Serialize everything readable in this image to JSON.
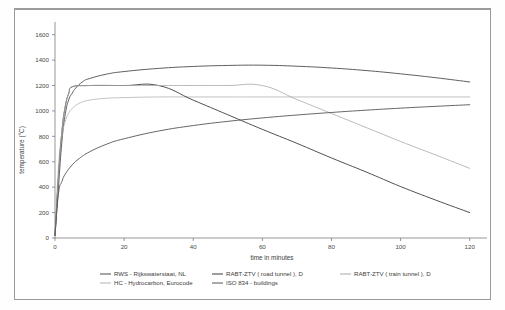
{
  "figure": {
    "frame_color": "#9a9a9a",
    "background": "#ffffff"
  },
  "axes": {
    "x_title": "time in minutes",
    "y_title": "temperature (°C)",
    "x_ticks": [
      "0",
      "20",
      "40",
      "60",
      "80",
      "100",
      "120"
    ],
    "y_ticks": [
      "0",
      "200",
      "400",
      "600",
      "800",
      "1000",
      "1200",
      "1400",
      "1600"
    ]
  },
  "legend": {
    "items": [
      {
        "label": "RWS - Rijkswaterstaat, NL",
        "color": "#4d4d4d",
        "name": "legend-rws"
      },
      {
        "label": "RABT-ZTV ( road tunnel ), D",
        "color": "#3d3d3d",
        "name": "legend-rabt-road"
      },
      {
        "label": "RABT-ZTV ( train tunnel ), D",
        "color": "#a8a8a8",
        "name": "legend-rabt-train"
      },
      {
        "label": "HC -  Hydrocarbon, Eurocode",
        "color": "#b3b3b3",
        "name": "legend-hc"
      },
      {
        "label": "ISO 834 - buildings",
        "color": "#555555",
        "name": "legend-iso834"
      }
    ]
  },
  "chart_data": {
    "type": "line",
    "title": "",
    "xlabel": "time in minutes",
    "ylabel": "temperature (°C)",
    "xlim": [
      0,
      125
    ],
    "ylim": [
      0,
      1700
    ],
    "xticks": [
      0,
      20,
      40,
      60,
      80,
      100,
      120
    ],
    "yticks": [
      0,
      200,
      400,
      600,
      800,
      1000,
      1200,
      1400,
      1600
    ],
    "grid": false,
    "legend_position": "below",
    "series": [
      {
        "name": "RWS - Rijkswaterstaat, NL",
        "color": "#4d4d4d",
        "width": 0.9,
        "x": [
          0,
          1,
          2,
          3,
          4,
          5,
          6,
          8,
          10,
          15,
          20,
          30,
          40,
          50,
          60,
          70,
          80,
          90,
          100,
          110,
          120
        ],
        "y": [
          20,
          400,
          760,
          980,
          1090,
          1140,
          1180,
          1230,
          1255,
          1290,
          1310,
          1335,
          1350,
          1358,
          1360,
          1352,
          1338,
          1318,
          1292,
          1262,
          1228
        ]
      },
      {
        "name": "HC - Hydrocarbon, Eurocode",
        "color": "#b3b3b3",
        "width": 0.8,
        "x": [
          0,
          1,
          2,
          3,
          4,
          5,
          7,
          10,
          15,
          20,
          30,
          40,
          50,
          60,
          80,
          100,
          120
        ],
        "y": [
          20,
          560,
          800,
          920,
          985,
          1020,
          1060,
          1085,
          1100,
          1105,
          1110,
          1110,
          1110,
          1110,
          1110,
          1110,
          1110
        ]
      },
      {
        "name": "RABT-ZTV ( road tunnel ), D",
        "color": "#3d3d3d",
        "width": 0.9,
        "x": [
          0,
          1,
          2,
          3,
          4,
          5,
          10,
          20,
          30,
          40,
          50,
          60,
          70,
          80,
          90,
          100,
          110,
          120
        ],
        "y": [
          20,
          480,
          840,
          1040,
          1140,
          1190,
          1200,
          1200,
          1200,
          1085,
          970,
          855,
          745,
          630,
          520,
          405,
          300,
          200
        ]
      },
      {
        "name": "RABT-ZTV ( train tunnel ), D",
        "color": "#a8a8a8",
        "width": 0.8,
        "x": [
          0,
          1,
          2,
          3,
          4,
          5,
          10,
          20,
          30,
          40,
          50,
          60,
          70,
          80,
          90,
          100,
          110,
          120
        ],
        "y": [
          20,
          480,
          840,
          1040,
          1140,
          1190,
          1200,
          1200,
          1200,
          1200,
          1200,
          1200,
          1090,
          980,
          870,
          760,
          655,
          548
        ]
      },
      {
        "name": "ISO 834 - buildings",
        "color": "#555555",
        "width": 0.9,
        "x": [
          0,
          1,
          2,
          3,
          5,
          7,
          10,
          15,
          20,
          30,
          40,
          50,
          60,
          70,
          80,
          90,
          100,
          110,
          120
        ],
        "y": [
          20,
          350,
          445,
          505,
          576,
          625,
          678,
          739,
          781,
          842,
          885,
          918,
          945,
          968,
          988,
          1006,
          1022,
          1036,
          1049
        ]
      }
    ]
  }
}
